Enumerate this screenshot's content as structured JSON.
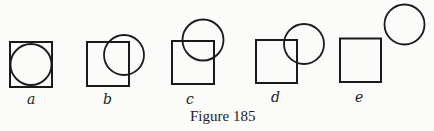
{
  "figure": {
    "caption": "Figure 185",
    "panels": [
      {
        "label": "a",
        "relation": "circle inscribed in square"
      },
      {
        "label": "b",
        "relation": "circle overlapping square"
      },
      {
        "label": "c",
        "relation": "circle overlapping square corner"
      },
      {
        "label": "d",
        "relation": "circle touching square corner"
      },
      {
        "label": "e",
        "relation": "circle separate from square"
      }
    ]
  }
}
